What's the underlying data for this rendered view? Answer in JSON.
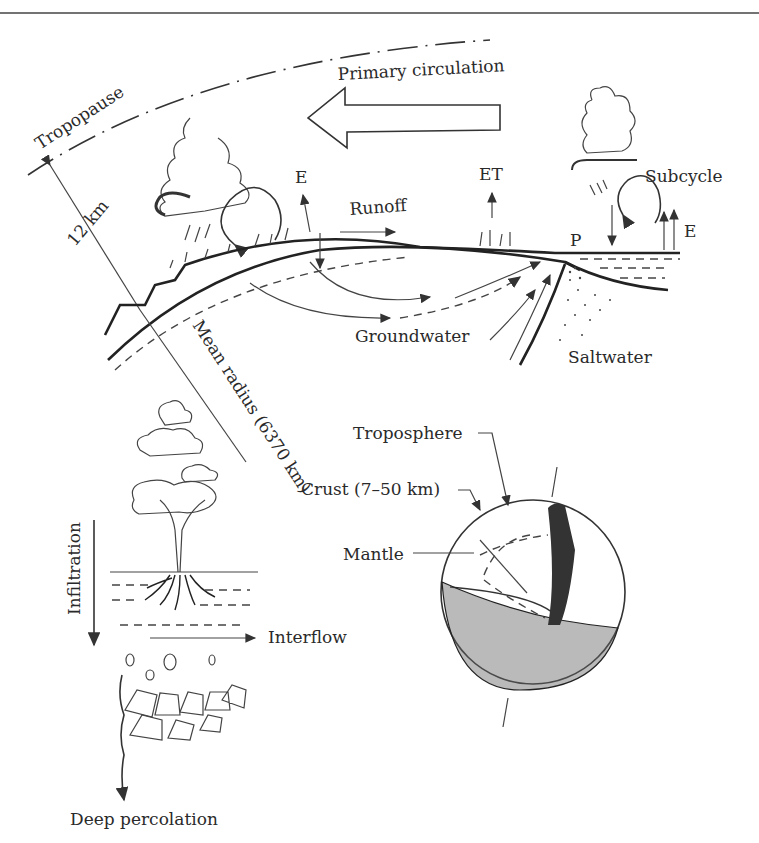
{
  "figure": {
    "labels": {
      "tropopause": "Tropopause",
      "primary_circulation": "Primary circulation",
      "height": "12 km",
      "evaporation_land": "E",
      "evapotranspiration": "ET",
      "runoff": "Runoff",
      "subcycle": "Subcycle",
      "precipitation": "P",
      "evaporation_sea": "E",
      "groundwater": "Groundwater",
      "saltwater": "Saltwater",
      "mean_radius": "Mean radius (6370 km)",
      "troposphere": "Troposphere",
      "crust": "Crust (7–50 km)",
      "mantle": "Mantle",
      "infiltration": "Infiltration",
      "interflow": "Interflow",
      "deep_percolation": "Deep percolation"
    },
    "colors": {
      "ink": "#2a2a2a",
      "background": "#ffffff"
    }
  }
}
